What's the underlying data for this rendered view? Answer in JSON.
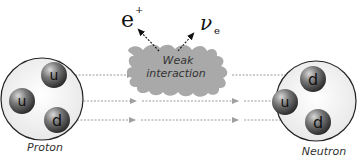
{
  "diagram": {
    "title_fragment": "",
    "interaction": {
      "label_line1": "Weak",
      "label_line2": "interaction",
      "fill": "#a9a9a9"
    },
    "emitted": [
      {
        "symbol": "e",
        "superscript": "+",
        "subscript": ""
      },
      {
        "symbol": "ν",
        "superscript": "",
        "subscript": "e"
      }
    ],
    "proton": {
      "label": "Proton",
      "quarks": [
        "u",
        "u",
        "d"
      ]
    },
    "neutron": {
      "label": "Neutron",
      "quarks": [
        "d",
        "u",
        "d"
      ]
    },
    "colors": {
      "quark": "#6e6e6e",
      "quark_highlight": "#d0d0d0",
      "particle_bg": "#f2f2f2",
      "outline": "#222222",
      "arrow": "#9a9a9a"
    }
  }
}
